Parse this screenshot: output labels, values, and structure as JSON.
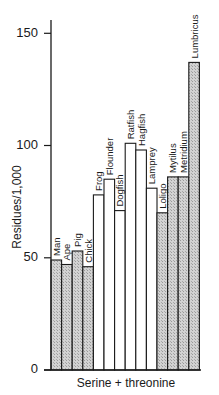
{
  "chart_data": {
    "type": "bar",
    "title": "",
    "xlabel": "Serine + threonine",
    "ylabel": "Residues/1,000",
    "ylim": [
      0,
      160
    ],
    "yticks": [
      0,
      50,
      100,
      150
    ],
    "grid": false,
    "legend": null,
    "categories": [
      "Man",
      "Ape",
      "Pig",
      "Chick",
      "Frog",
      "Flounder",
      "Dogfish",
      "Ratfish",
      "Hagfish",
      "Lamprey",
      "Loligo",
      "Mytilus",
      "Metridium",
      "Lumbricus"
    ],
    "values": [
      49,
      47,
      53,
      46,
      78,
      85,
      71,
      101,
      98,
      81,
      70,
      86,
      86,
      137
    ],
    "bar_styles": [
      "shaded",
      "shaded",
      "shaded",
      "shaded",
      "open",
      "open",
      "open",
      "open",
      "open",
      "open",
      "shaded",
      "shaded",
      "shaded",
      "shaded"
    ],
    "groups": [
      {
        "name": "Mammals/birds",
        "style": "shaded",
        "members": [
          "Man",
          "Ape",
          "Pig",
          "Chick"
        ]
      },
      {
        "name": "Lower vertebrates",
        "style": "open",
        "members": [
          "Frog",
          "Flounder",
          "Dogfish",
          "Ratfish",
          "Hagfish",
          "Lamprey"
        ]
      },
      {
        "name": "Invertebrates",
        "style": "shaded",
        "members": [
          "Loligo",
          "Mytilus",
          "Metridium",
          "Lumbricus"
        ]
      }
    ]
  },
  "axis": {
    "y_label": "Residues/1,000",
    "x_label": "Serine + threonine",
    "tick_labels": [
      "0",
      "50",
      "100",
      "150"
    ]
  },
  "colors": {
    "shaded": "#c8c8c8",
    "open": "#ffffff",
    "stroke": "#1a1a1a"
  }
}
